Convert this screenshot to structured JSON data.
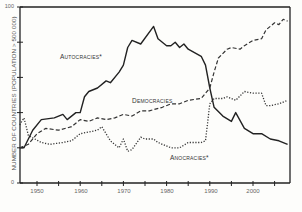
{
  "chart_data": {
    "type": "line",
    "title": "",
    "xlabel": "",
    "ylabel": "NUMBER OF COUNTRIES (POPULATION > 500 000)",
    "xlim": [
      1946,
      2008
    ],
    "ylim": [
      0,
      100
    ],
    "x_ticks": [
      1950,
      1960,
      1970,
      1980,
      1990,
      2000
    ],
    "y_ticks": [
      0,
      20,
      40,
      60,
      80,
      100
    ],
    "y_tick_labels": {
      "0": "0",
      "100": "100"
    },
    "grid": false,
    "legend": "inline labels",
    "source": "Source: Marshall and Cole 2009",
    "series": [
      {
        "name": "AUTOCRACIES*",
        "style": "solid",
        "points": [
          [
            1946,
            20
          ],
          [
            1947,
            20
          ],
          [
            1949,
            30
          ],
          [
            1951,
            36
          ],
          [
            1954,
            37
          ],
          [
            1956,
            39
          ],
          [
            1957,
            36
          ],
          [
            1959,
            40
          ],
          [
            1960,
            40
          ],
          [
            1961,
            49
          ],
          [
            1962,
            52
          ],
          [
            1964,
            54
          ],
          [
            1966,
            58
          ],
          [
            1967,
            57
          ],
          [
            1969,
            63
          ],
          [
            1970,
            67
          ],
          [
            1971,
            77
          ],
          [
            1972,
            81
          ],
          [
            1974,
            79
          ],
          [
            1977,
            89
          ],
          [
            1978,
            82
          ],
          [
            1980,
            78
          ],
          [
            1981,
            78
          ],
          [
            1982,
            80
          ],
          [
            1983,
            77
          ],
          [
            1984,
            79
          ],
          [
            1985,
            76
          ],
          [
            1988,
            72
          ],
          [
            1989,
            67
          ],
          [
            1990,
            54
          ],
          [
            1991,
            43
          ],
          [
            1993,
            38
          ],
          [
            1995,
            35
          ],
          [
            1996,
            40
          ],
          [
            1998,
            31
          ],
          [
            2000,
            28
          ],
          [
            2002,
            28
          ],
          [
            2004,
            25
          ],
          [
            2006,
            24
          ],
          [
            2008,
            22
          ]
        ]
      },
      {
        "name": "DEMOCRACIES",
        "style": "dashed",
        "points": [
          [
            1946,
            20
          ],
          [
            1948,
            22
          ],
          [
            1950,
            28
          ],
          [
            1952,
            31
          ],
          [
            1955,
            30
          ],
          [
            1958,
            32
          ],
          [
            1960,
            36
          ],
          [
            1962,
            35
          ],
          [
            1964,
            37
          ],
          [
            1966,
            36
          ],
          [
            1968,
            37
          ],
          [
            1970,
            39
          ],
          [
            1972,
            38
          ],
          [
            1974,
            41
          ],
          [
            1976,
            41
          ],
          [
            1979,
            43
          ],
          [
            1981,
            45
          ],
          [
            1983,
            45
          ],
          [
            1985,
            47
          ],
          [
            1988,
            48
          ],
          [
            1990,
            54
          ],
          [
            1991,
            63
          ],
          [
            1992,
            71
          ],
          [
            1994,
            76
          ],
          [
            1995,
            77
          ],
          [
            1997,
            76
          ],
          [
            1998,
            78
          ],
          [
            2000,
            81
          ],
          [
            2002,
            82
          ],
          [
            2003,
            87
          ],
          [
            2005,
            91
          ],
          [
            2006,
            90
          ],
          [
            2007,
            93
          ],
          [
            2008,
            92
          ]
        ]
      },
      {
        "name": "ANOCRACIES*",
        "style": "dotted",
        "points": [
          [
            1946,
            33
          ],
          [
            1947,
            37
          ],
          [
            1948,
            27
          ],
          [
            1951,
            23
          ],
          [
            1953,
            22
          ],
          [
            1956,
            23
          ],
          [
            1958,
            24
          ],
          [
            1960,
            28
          ],
          [
            1962,
            29
          ],
          [
            1964,
            30
          ],
          [
            1965,
            32
          ],
          [
            1967,
            24
          ],
          [
            1969,
            20
          ],
          [
            1970,
            25
          ],
          [
            1971,
            18
          ],
          [
            1972,
            19
          ],
          [
            1974,
            26
          ],
          [
            1975,
            25
          ],
          [
            1977,
            25
          ],
          [
            1978,
            23
          ],
          [
            1981,
            20
          ],
          [
            1983,
            20
          ],
          [
            1985,
            23
          ],
          [
            1988,
            23
          ],
          [
            1989,
            24
          ],
          [
            1990,
            45
          ],
          [
            1991,
            48
          ],
          [
            1993,
            48
          ],
          [
            1994,
            49
          ],
          [
            1996,
            47
          ],
          [
            1998,
            52
          ],
          [
            2000,
            51
          ],
          [
            2002,
            51
          ],
          [
            2003,
            44
          ],
          [
            2004,
            44
          ],
          [
            2006,
            45
          ],
          [
            2008,
            47
          ]
        ]
      }
    ],
    "annotations": [
      {
        "text": "AUTOCRACIES*",
        "x": 1952,
        "y": 73
      },
      {
        "text": "DEMOCRACIES",
        "x": 1976,
        "y": 48
      },
      {
        "text": "ANOCRACIES*",
        "x": 1984,
        "y": 15
      }
    ]
  },
  "labels": {
    "ylabel": "NUMBER OF COUNTRIES (POPULATION > 500 000)",
    "source": "Source: Marshall and Cole 2009",
    "autocracies": "Autocracies*",
    "democracies": "Democracies",
    "anocracies": "Anocracies*",
    "y_top": "100",
    "y_bottom": "0",
    "x_1950": "1950",
    "x_1960": "1960",
    "x_1970": "1970",
    "x_1980": "1980",
    "x_1990": "1990",
    "x_2000": "2000"
  }
}
